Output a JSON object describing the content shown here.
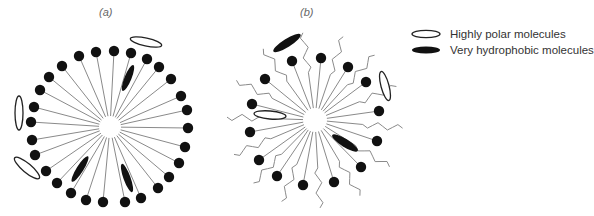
{
  "panels": [
    {
      "label": "(a)",
      "type": "micelle"
    },
    {
      "label": "(b)",
      "type": "reverse-micelle-with-tails"
    }
  ],
  "legend": [
    {
      "label": "Highly polar molecules",
      "style": "open-ellipse"
    },
    {
      "label": "Very hydrophobic molecules",
      "style": "filled-ellipse"
    }
  ],
  "colors": {
    "head": "#111111",
    "stalk": "#8a8a8a",
    "ellipse_stroke": "#222222",
    "label": "#666666",
    "legend_text": "#333333"
  },
  "panel_a": {
    "center": [
      110,
      127
    ],
    "heads": [
      [
        114,
        51
      ],
      [
        131,
        53
      ],
      [
        147,
        59
      ],
      [
        159,
        67
      ],
      [
        171,
        79
      ],
      [
        181,
        96
      ],
      [
        187,
        110
      ],
      [
        188,
        128
      ],
      [
        185,
        147
      ],
      [
        179,
        163
      ],
      [
        169,
        177
      ],
      [
        158,
        188
      ],
      [
        141,
        198
      ],
      [
        125,
        202
      ],
      [
        103,
        202
      ],
      [
        86,
        200
      ],
      [
        71,
        193
      ],
      [
        57,
        183
      ],
      [
        46,
        171
      ],
      [
        35,
        155
      ],
      [
        32,
        140
      ],
      [
        31,
        122
      ],
      [
        34,
        107
      ],
      [
        40,
        90
      ],
      [
        49,
        77
      ],
      [
        62,
        66
      ],
      [
        79,
        56
      ],
      [
        96,
        52
      ]
    ],
    "open_ellipses": [
      {
        "cx": 146,
        "cy": 42,
        "rx": 16,
        "ry": 4,
        "rot": 12
      },
      {
        "cx": 19,
        "cy": 113,
        "rx": 4,
        "ry": 17,
        "rot": 0
      },
      {
        "cx": 27,
        "cy": 168,
        "rx": 16,
        "ry": 4.5,
        "rot": 40
      }
    ],
    "filled_ellipses": [
      {
        "cx": 128,
        "cy": 78,
        "rx": 14,
        "ry": 3.5,
        "rot": -68
      },
      {
        "cx": 80,
        "cy": 169,
        "rx": 15,
        "ry": 3.5,
        "rot": -58
      },
      {
        "cx": 127,
        "cy": 178,
        "rx": 15,
        "ry": 3.5,
        "rot": 70
      }
    ]
  },
  "panel_b": {
    "center": [
      315,
      120
    ],
    "heads": [
      [
        292,
        61
      ],
      [
        321,
        58
      ],
      [
        348,
        67
      ],
      [
        366,
        82
      ],
      [
        379,
        111
      ],
      [
        377,
        141
      ],
      [
        361,
        167
      ],
      [
        334,
        182
      ],
      [
        303,
        185
      ],
      [
        277,
        176
      ],
      [
        259,
        160
      ],
      [
        250,
        132
      ],
      [
        252,
        104
      ],
      [
        265,
        79
      ]
    ],
    "open_ellipses": [
      {
        "cx": 385,
        "cy": 86,
        "rx": 4,
        "ry": 15,
        "rot": -15
      },
      {
        "cx": 270,
        "cy": 115,
        "rx": 16,
        "ry": 4,
        "rot": 5
      }
    ],
    "filled_ellipses": [
      {
        "cx": 287,
        "cy": 43,
        "rx": 16,
        "ry": 4,
        "rot": -32
      },
      {
        "cx": 345,
        "cy": 143,
        "rx": 15,
        "ry": 4,
        "rot": 32
      }
    ]
  }
}
